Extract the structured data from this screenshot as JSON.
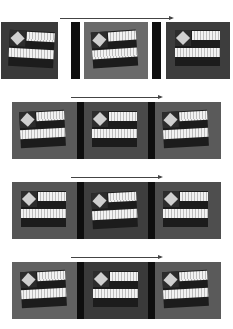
{
  "figure": {
    "rows": [
      {
        "index": 1,
        "arrow": {
          "x1": 60,
          "x2": 172,
          "y": 18
        },
        "panels": [
          {
            "x": 1,
            "y": 22,
            "w": 57,
            "h": 57,
            "bg": "#3a3a3a",
            "flag_x": 8,
            "flag_y": 9,
            "tilt": 3
          },
          {
            "x": 84,
            "y": 22,
            "w": 64,
            "h": 57,
            "bg": "#6a6a6a",
            "flag_x": 8,
            "flag_y": 9,
            "tilt": -4
          },
          {
            "x": 166,
            "y": 22,
            "w": 64,
            "h": 57,
            "bg": "#3d3d3d",
            "flag_x": 9,
            "flag_y": 8,
            "tilt": 0
          }
        ],
        "separators": [
          {
            "x": 71,
            "y": 22,
            "w": 9,
            "h": 57
          },
          {
            "x": 152,
            "y": 22,
            "w": 9,
            "h": 57
          }
        ]
      },
      {
        "index": 2,
        "arrow": {
          "x1": 71,
          "x2": 161,
          "y": 97
        },
        "panels": [
          {
            "x": 12,
            "y": 102,
            "w": 65,
            "h": 57,
            "bg": "#5a5a5a",
            "flag_x": 8,
            "flag_y": 9,
            "tilt": -3
          },
          {
            "x": 84,
            "y": 102,
            "w": 64,
            "h": 57,
            "bg": "#4a4a4a",
            "flag_x": 8,
            "flag_y": 9,
            "tilt": 0
          },
          {
            "x": 155,
            "y": 102,
            "w": 66,
            "h": 57,
            "bg": "#5a5a5a",
            "flag_x": 8,
            "flag_y": 9,
            "tilt": -3
          }
        ],
        "separators": [
          {
            "x": 77,
            "y": 102,
            "w": 7,
            "h": 57
          },
          {
            "x": 148,
            "y": 102,
            "w": 7,
            "h": 57
          }
        ]
      },
      {
        "index": 3,
        "arrow": {
          "x1": 71,
          "x2": 161,
          "y": 177
        },
        "panels": [
          {
            "x": 12,
            "y": 182,
            "w": 65,
            "h": 57,
            "bg": "#555555",
            "flag_x": 9,
            "flag_y": 9,
            "tilt": 0
          },
          {
            "x": 84,
            "y": 182,
            "w": 64,
            "h": 57,
            "bg": "#3e3e3e",
            "flag_x": 8,
            "flag_y": 10,
            "tilt": -3
          },
          {
            "x": 155,
            "y": 182,
            "w": 66,
            "h": 57,
            "bg": "#4e4e4e",
            "flag_x": 8,
            "flag_y": 9,
            "tilt": 0
          }
        ],
        "separators": [
          {
            "x": 77,
            "y": 182,
            "w": 7,
            "h": 57
          },
          {
            "x": 148,
            "y": 182,
            "w": 7,
            "h": 57
          }
        ]
      },
      {
        "index": 4,
        "arrow": {
          "x1": 71,
          "x2": 161,
          "y": 257
        },
        "panels": [
          {
            "x": 12,
            "y": 262,
            "w": 65,
            "h": 57,
            "bg": "#616161",
            "flag_x": 9,
            "flag_y": 9,
            "tilt": -3
          },
          {
            "x": 84,
            "y": 262,
            "w": 64,
            "h": 57,
            "bg": "#3a3a3a",
            "flag_x": 9,
            "flag_y": 9,
            "tilt": 0
          },
          {
            "x": 155,
            "y": 262,
            "w": 66,
            "h": 57,
            "bg": "#5a5a5a",
            "flag_x": 8,
            "flag_y": 9,
            "tilt": -3
          }
        ],
        "separators": [
          {
            "x": 77,
            "y": 262,
            "w": 7,
            "h": 57
          },
          {
            "x": 148,
            "y": 262,
            "w": 7,
            "h": 57
          }
        ]
      }
    ]
  }
}
